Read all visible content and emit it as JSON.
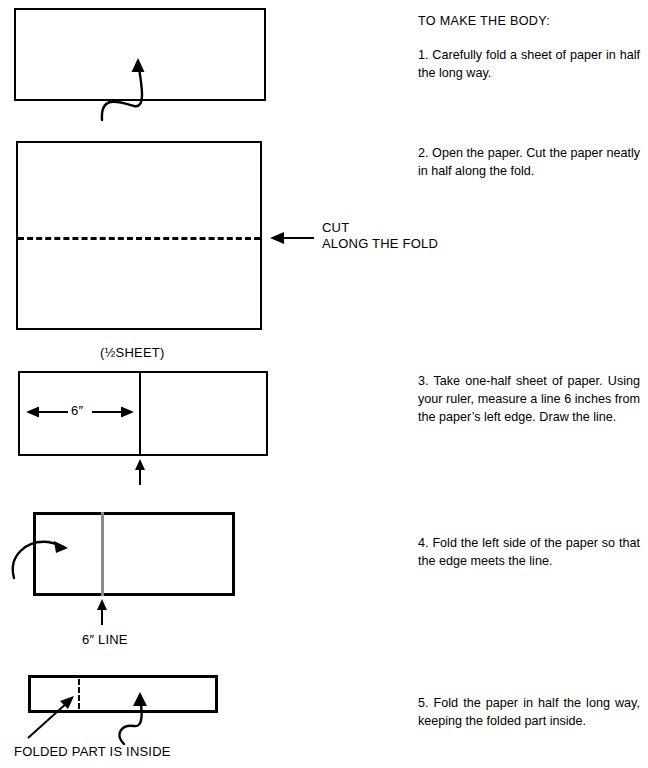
{
  "document": {
    "title": "TO MAKE THE BODY:",
    "heading": "TO MAKE THE BODY:"
  },
  "instructions": [
    {
      "number": "1.",
      "text": "1.  Carefully fold a sheet of paper in half the long way."
    },
    {
      "number": "2.",
      "text": "2.  Open the paper. Cut the paper neatly in half along the fold."
    },
    {
      "number": "3.",
      "text": "3. Take one-half sheet of paper. Using your ruler, measure a line 6 inches from the paper’s left edge. Draw the line."
    },
    {
      "number": "4.",
      "text": "4.  Fold the left side of the paper so that the edge meets the line."
    },
    {
      "number": "5.",
      "text": "5.  Fold the paper in half the long way, keeping the folded part inside."
    }
  ],
  "figure_labels": {
    "cut_line_1": "CUT",
    "cut_line_2": "ALONG THE FOLD",
    "half_sheet": "(½SHEET)",
    "six_inch_dimension": "6″",
    "six_inch_line": "6″ LINE",
    "folded_part": "FOLDED PART IS INSIDE"
  },
  "colors": {
    "ink": "#000000",
    "paper": "#ffffff",
    "soft_fold": "#8a8a8a"
  }
}
